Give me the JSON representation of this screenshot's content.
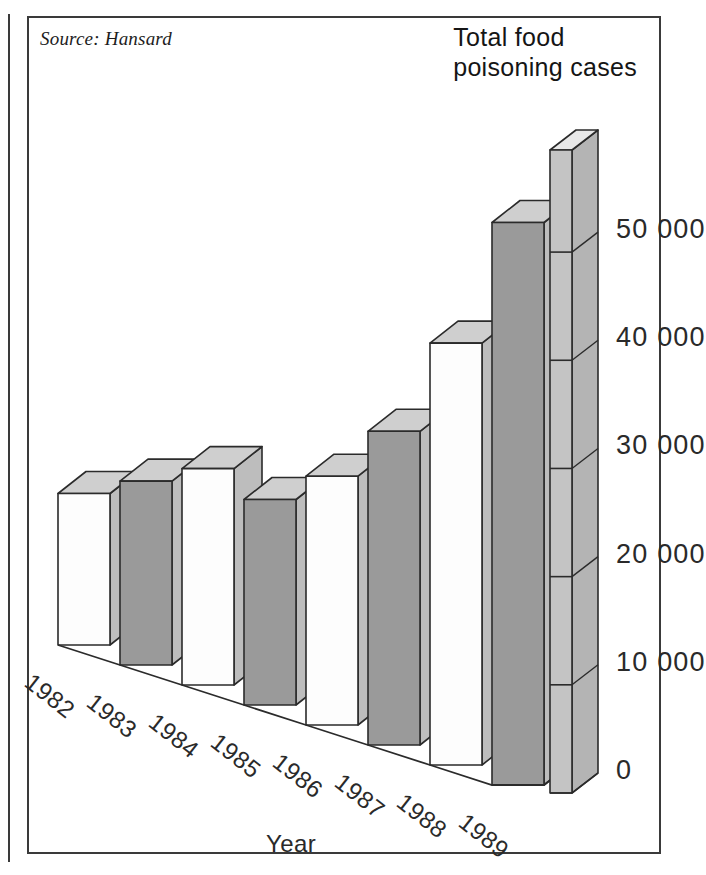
{
  "source_note": "Source: Hansard",
  "title_line1": "Total food",
  "title_line2": "poisoning cases",
  "axis_title_x": "Year",
  "colors": {
    "ink": "#2a2a2a",
    "frame": "#3a3a3a",
    "bar_front_light": "#fdfdfd",
    "bar_front_dark": "#9a9a9a",
    "bar_top": "#cfcfcf",
    "bar_side": "#bdbdbd",
    "axis_slab": "#c4c4c4",
    "background": "#ffffff"
  },
  "chart_data": {
    "type": "bar",
    "title": "Total food poisoning cases",
    "subtitle": "Source: Hansard",
    "xlabel": "Year",
    "ylabel": "",
    "categories": [
      "1982",
      "1983",
      "1984",
      "1985",
      "1986",
      "1987",
      "1988",
      "1989"
    ],
    "values": [
      14000,
      17000,
      20000,
      19000,
      23000,
      29000,
      39000,
      52000
    ],
    "ylim": [
      0,
      55000
    ],
    "yticks": [
      0,
      10000,
      20000,
      30000,
      40000,
      50000
    ],
    "ytick_labels": [
      "0",
      "10 000",
      "20 000",
      "30 000",
      "40 000",
      "50 000"
    ],
    "grid": false,
    "legend": "none",
    "projection": "3d-isometric",
    "bar_fills": [
      "light",
      "dark",
      "light",
      "dark",
      "light",
      "dark",
      "light",
      "dark"
    ]
  },
  "y_axis": {
    "labels": [
      {
        "text": "50 000",
        "value": 50000
      },
      {
        "text": "40 000",
        "value": 40000
      },
      {
        "text": "30 000",
        "value": 30000
      },
      {
        "text": "20 000",
        "value": 20000
      },
      {
        "text": "10 000",
        "value": 10000
      },
      {
        "text": "0",
        "value": 0
      }
    ]
  },
  "x_axis": {
    "labels": [
      "1982",
      "1983",
      "1984",
      "1985",
      "1986",
      "1987",
      "1988",
      "1989"
    ]
  }
}
